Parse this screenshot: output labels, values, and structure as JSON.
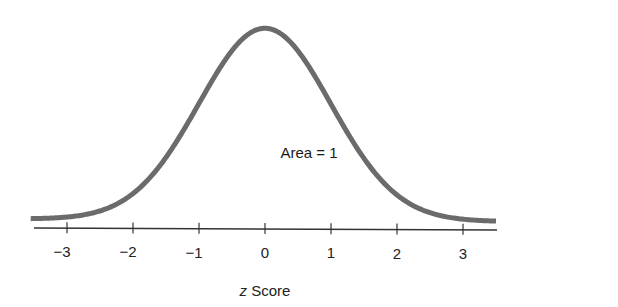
{
  "chart_data": {
    "type": "line",
    "title": "",
    "xlabel": "z Score",
    "xlabel_italic_part": "z",
    "xlabel_rest": " Score",
    "ylabel": "",
    "xlim": [
      -3.5,
      3.5
    ],
    "xticks": [
      -3,
      -2,
      -1,
      0,
      1,
      2,
      3
    ],
    "xtick_labels": [
      "−3",
      "−2",
      "−1",
      "0",
      "1",
      "2",
      "3"
    ],
    "grid": false,
    "legend": null,
    "annotations": [
      {
        "text": "Area = 1",
        "x": 0,
        "position": "inside curve, center"
      }
    ],
    "series": [
      {
        "name": "Standard normal density",
        "function": "phi(z) = exp(-z^2/2)/sqrt(2*pi)",
        "x": [
          -3.5,
          -3,
          -2.5,
          -2,
          -1.5,
          -1,
          -0.5,
          0,
          0.5,
          1,
          1.5,
          2,
          2.5,
          3,
          3.5
        ],
        "y": [
          0.0009,
          0.0044,
          0.0175,
          0.054,
          0.1295,
          0.242,
          0.3521,
          0.3989,
          0.3521,
          0.242,
          0.1295,
          0.054,
          0.0175,
          0.0044,
          0.0009
        ]
      }
    ],
    "colors": {
      "curve": "#6b6b6b",
      "axis": "#333333",
      "text": "#222222"
    }
  }
}
